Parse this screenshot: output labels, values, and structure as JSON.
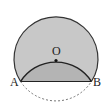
{
  "diagram": {
    "type": "geometry-circle-fold",
    "labels": {
      "center": "O",
      "left_point": "A",
      "right_point": "B"
    },
    "colors": {
      "outer_fill": "#c8c8c8",
      "inner_segment_fill": "#b4b4b4",
      "stroke": "#333333",
      "dashed_arc": "#666666"
    }
  }
}
